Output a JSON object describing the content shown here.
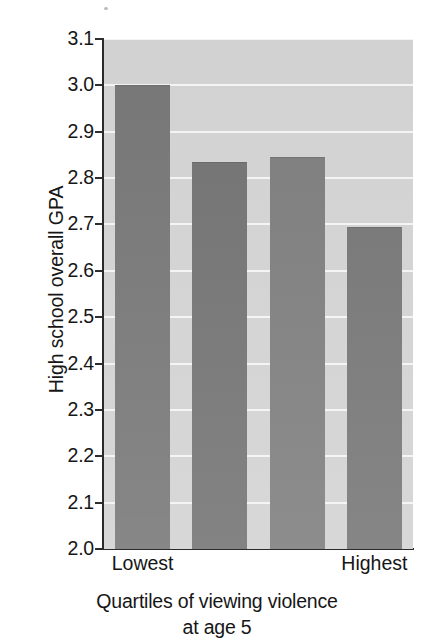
{
  "chart_data": {
    "type": "bar",
    "title": "",
    "subtitle": "",
    "xlabel": "Quartiles of viewing violence at age 5",
    "xlabel_line1": "Quartiles of viewing violence",
    "xlabel_line2": "at age 5",
    "ylabel": "High school overall GPA",
    "categories": [
      "Lowest",
      "",
      "",
      "Highest"
    ],
    "tick_labels_shown": [
      "Lowest",
      "Highest"
    ],
    "values": [
      3.0,
      2.835,
      2.845,
      2.695
    ],
    "ylim": [
      2.0,
      3.1
    ],
    "ytick_values": [
      2.0,
      2.1,
      2.2,
      2.3,
      2.4,
      2.5,
      2.6,
      2.7,
      2.8,
      2.9,
      3.0,
      3.1
    ],
    "ytick_labels": [
      "2.0",
      "2.1",
      "2.2",
      "2.3",
      "2.4",
      "2.5",
      "2.6",
      "2.7",
      "2.8",
      "2.9",
      "3.0",
      "3.1"
    ],
    "grid": true,
    "grid_orientation": "horizontal",
    "legend": null,
    "legend_position": "none",
    "bar_color": "#7c7c7c",
    "plot_background": "#d2d2d2",
    "gridline_color": "#f4f4f4",
    "axis_color": "#2b2b2b",
    "text_color": "#161616"
  },
  "axes": {
    "y_title": "High school overall GPA",
    "x_title_line1": "Quartiles of viewing violence",
    "x_title_line2": "at age 5"
  }
}
